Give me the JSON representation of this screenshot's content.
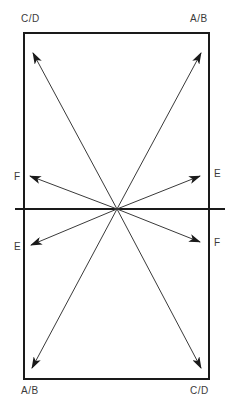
{
  "diagram": {
    "colors": {
      "line": "#1a1a1a",
      "arrow": "#3a3a3a",
      "label": "#3a3a3a",
      "background": "#ffffff"
    },
    "frame": {
      "x": 24,
      "y": 33,
      "width": 185,
      "height": 346
    },
    "horizon": {
      "x1": 15,
      "y1": 209,
      "x2": 225,
      "y2": 209
    },
    "center": {
      "x": 117,
      "y": 209
    },
    "labels": {
      "top_left": "C/D",
      "top_right": "A/B",
      "mid_left_upper": "F",
      "mid_right_upper": "E",
      "mid_left_lower": "E",
      "mid_right_lower": "F",
      "bottom_left": "A/B",
      "bottom_right": "C/D"
    },
    "arrows": [
      {
        "name": "arrow-to-top-left",
        "target": "C/D",
        "x2": 33,
        "y2": 53
      },
      {
        "name": "arrow-to-top-right",
        "target": "A/B",
        "x2": 201,
        "y2": 53
      },
      {
        "name": "arrow-to-left-upper",
        "target": "F",
        "x2": 30,
        "y2": 176
      },
      {
        "name": "arrow-to-right-upper",
        "target": "E",
        "x2": 200,
        "y2": 176
      },
      {
        "name": "arrow-to-left-lower",
        "target": "E",
        "x2": 31,
        "y2": 245
      },
      {
        "name": "arrow-to-right-lower",
        "target": "F",
        "x2": 200,
        "y2": 242
      },
      {
        "name": "arrow-to-bottom-left",
        "target": "A/B",
        "x2": 32,
        "y2": 368
      },
      {
        "name": "arrow-to-bottom-right",
        "target": "C/D",
        "x2": 201,
        "y2": 368
      }
    ]
  }
}
